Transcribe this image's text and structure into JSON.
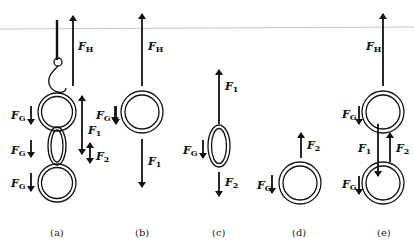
{
  "figure": {
    "topline_color": "#c8c8c8",
    "ink_color": "#111111",
    "panels": [
      {
        "id": "a",
        "caption": "(a)",
        "description": "Chain of three links hanging from a hook",
        "forces": [
          {
            "label": "F",
            "sub": "H",
            "direction": "up"
          },
          {
            "label": "F",
            "sub": "G",
            "direction": "down"
          },
          {
            "label": "F",
            "sub": "1",
            "direction": "up-down"
          },
          {
            "label": "F",
            "sub": "G",
            "direction": "down"
          },
          {
            "label": "F",
            "sub": "2",
            "direction": "up-down"
          },
          {
            "label": "F",
            "sub": "G",
            "direction": "down"
          }
        ]
      },
      {
        "id": "b",
        "caption": "(b)",
        "description": "Free-body diagram of top ring",
        "forces": [
          {
            "label": "F",
            "sub": "H",
            "direction": "up"
          },
          {
            "label": "F",
            "sub": "G",
            "direction": "down"
          },
          {
            "label": "F",
            "sub": "1",
            "direction": "down"
          }
        ]
      },
      {
        "id": "c",
        "caption": "(c)",
        "description": "Free-body diagram of middle oval link",
        "forces": [
          {
            "label": "F",
            "sub": "1",
            "direction": "up"
          },
          {
            "label": "F",
            "sub": "G",
            "direction": "down"
          },
          {
            "label": "F",
            "sub": "2",
            "direction": "down"
          }
        ]
      },
      {
        "id": "d",
        "caption": "(d)",
        "description": "Free-body diagram of bottom ring",
        "forces": [
          {
            "label": "F",
            "sub": "2",
            "direction": "up"
          },
          {
            "label": "F",
            "sub": "G",
            "direction": "down"
          }
        ]
      },
      {
        "id": "e",
        "caption": "(e)",
        "description": "Free-body diagram of two rings",
        "forces": [
          {
            "label": "F",
            "sub": "H",
            "direction": "up"
          },
          {
            "label": "F",
            "sub": "G",
            "direction": "down"
          },
          {
            "label": "F",
            "sub": "1",
            "direction": "down"
          },
          {
            "label": "F",
            "sub": "2",
            "direction": "up"
          },
          {
            "label": "F",
            "sub": "G",
            "direction": "down"
          }
        ]
      }
    ]
  }
}
